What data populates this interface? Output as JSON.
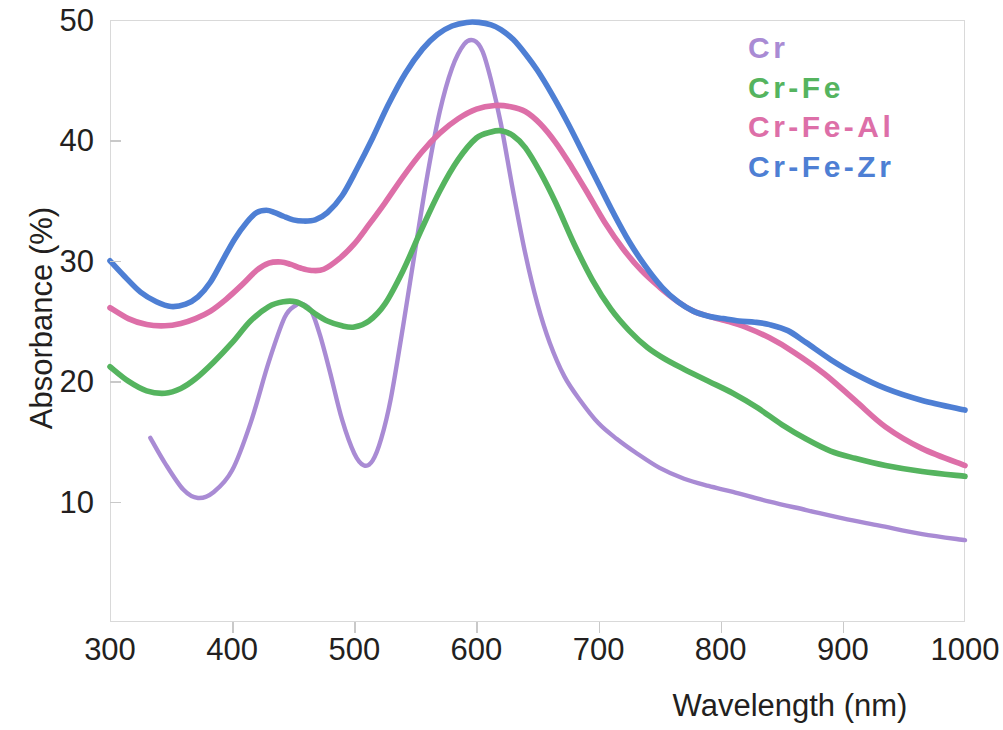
{
  "chart_data": {
    "type": "line",
    "title": "",
    "xlabel": "Wavelength (nm)",
    "ylabel": "Absorbance (%)",
    "xlim": [
      300,
      1000
    ],
    "ylim": [
      0,
      50
    ],
    "xticks": [
      300,
      400,
      500,
      600,
      700,
      800,
      900,
      1000
    ],
    "yticks": [
      10,
      20,
      30,
      40,
      50
    ],
    "grid": false,
    "legend_position": "top-right",
    "series": [
      {
        "name": "Cr",
        "color": "#a98bd4",
        "x": [
          333,
          345,
          360,
          372,
          385,
          400,
          415,
          430,
          443,
          452,
          458,
          465,
          472,
          480,
          490,
          500,
          508,
          515,
          522,
          530,
          540,
          550,
          560,
          570,
          580,
          590,
          598,
          605,
          612,
          620,
          630,
          640,
          650,
          660,
          672,
          685,
          700,
          715,
          730,
          750,
          770,
          790,
          810,
          840,
          870,
          900,
          930,
          965,
          1000
        ],
        "y": [
          15.3,
          13.2,
          11.0,
          10.3,
          10.8,
          12.6,
          16.5,
          21.6,
          25.3,
          26.3,
          26.4,
          25.8,
          23.8,
          20.8,
          16.8,
          14.0,
          13.0,
          13.4,
          15.2,
          18.6,
          24.6,
          31.0,
          37.2,
          42.4,
          46.0,
          48.0,
          48.3,
          47.4,
          45.0,
          41.4,
          35.8,
          30.6,
          26.4,
          23.2,
          20.4,
          18.4,
          16.5,
          15.2,
          14.1,
          12.8,
          11.9,
          11.3,
          10.8,
          10.0,
          9.3,
          8.6,
          8.0,
          7.3,
          6.8
        ]
      },
      {
        "name": "Cr-Fe",
        "color": "#55b45f",
        "x": [
          300,
          315,
          330,
          345,
          358,
          370,
          385,
          400,
          415,
          430,
          442,
          452,
          460,
          468,
          478,
          490,
          500,
          512,
          525,
          540,
          555,
          570,
          585,
          600,
          612,
          620,
          630,
          640,
          652,
          665,
          680,
          695,
          710,
          725,
          740,
          755,
          770,
          790,
          810,
          830,
          850,
          870,
          890,
          910,
          935,
          965,
          1000
        ],
        "y": [
          21.2,
          20.0,
          19.2,
          19.0,
          19.4,
          20.2,
          21.6,
          23.2,
          25.0,
          26.2,
          26.6,
          26.6,
          26.2,
          25.6,
          25.0,
          24.6,
          24.5,
          25.0,
          26.4,
          29.2,
          32.6,
          35.8,
          38.4,
          40.2,
          40.7,
          40.8,
          40.4,
          39.4,
          37.4,
          34.8,
          31.4,
          28.4,
          26.0,
          24.2,
          22.8,
          21.8,
          21.0,
          20.0,
          19.0,
          17.8,
          16.4,
          15.2,
          14.2,
          13.6,
          13.0,
          12.5,
          12.1
        ]
      },
      {
        "name": "Cr-Fe-Al",
        "color": "#dd6fa8",
        "x": [
          300,
          315,
          330,
          345,
          358,
          370,
          382,
          395,
          408,
          420,
          430,
          440,
          448,
          456,
          465,
          475,
          488,
          500,
          512,
          525,
          540,
          555,
          570,
          585,
          600,
          615,
          628,
          640,
          652,
          665,
          678,
          690,
          705,
          720,
          735,
          750,
          765,
          778,
          790,
          805,
          820,
          840,
          860,
          885,
          910,
          935,
          965,
          1000
        ],
        "y": [
          26.1,
          25.2,
          24.7,
          24.6,
          24.8,
          25.2,
          25.8,
          26.8,
          28.0,
          29.2,
          29.8,
          29.9,
          29.7,
          29.4,
          29.2,
          29.3,
          30.2,
          31.4,
          33.0,
          34.8,
          37.0,
          39.0,
          40.6,
          41.8,
          42.6,
          42.9,
          42.8,
          42.4,
          41.4,
          39.8,
          37.8,
          35.8,
          33.2,
          31.0,
          29.2,
          27.8,
          26.6,
          25.8,
          25.4,
          25.0,
          24.5,
          23.6,
          22.4,
          20.6,
          18.4,
          16.2,
          14.4,
          13.0
        ]
      },
      {
        "name": "Cr-Fe-Zr",
        "color": "#4e7fd4",
        "x": [
          300,
          312,
          325,
          338,
          350,
          362,
          372,
          382,
          392,
          402,
          412,
          420,
          428,
          435,
          442,
          450,
          458,
          468,
          478,
          490,
          502,
          515,
          528,
          542,
          556,
          568,
          580,
          592,
          602,
          612,
          620,
          630,
          640,
          650,
          662,
          675,
          688,
          700,
          712,
          725,
          738,
          752,
          765,
          778,
          790,
          802,
          815,
          828,
          840,
          855,
          870,
          890,
          910,
          935,
          965,
          1000
        ],
        "y": [
          30.0,
          28.7,
          27.4,
          26.6,
          26.2,
          26.4,
          27.0,
          28.2,
          30.0,
          31.8,
          33.2,
          34.0,
          34.2,
          34.0,
          33.7,
          33.4,
          33.3,
          33.4,
          34.0,
          35.4,
          37.6,
          40.2,
          43.0,
          45.6,
          47.6,
          48.8,
          49.5,
          49.8,
          49.8,
          49.6,
          49.2,
          48.4,
          47.2,
          45.8,
          43.8,
          41.4,
          38.8,
          36.4,
          34.0,
          31.6,
          29.6,
          27.8,
          26.6,
          25.8,
          25.4,
          25.2,
          25.0,
          24.9,
          24.7,
          24.2,
          23.2,
          21.8,
          20.6,
          19.4,
          18.4,
          17.6
        ]
      }
    ]
  },
  "axes": {
    "y_title": "Absorbance (%)",
    "x_title": "Wavelength (nm)",
    "y_tick_labels": [
      "50",
      "40",
      "30",
      "20",
      "10"
    ],
    "x_tick_labels": [
      "300",
      "400",
      "500",
      "600",
      "700",
      "800",
      "900",
      "1000"
    ]
  },
  "legend": {
    "items": [
      {
        "label": "Cr",
        "color": "#a98bd4"
      },
      {
        "label": "Cr-Fe",
        "color": "#55b45f"
      },
      {
        "label": "Cr-Fe-Al",
        "color": "#dd6fa8"
      },
      {
        "label": "Cr-Fe-Zr",
        "color": "#4e7fd4"
      }
    ]
  }
}
